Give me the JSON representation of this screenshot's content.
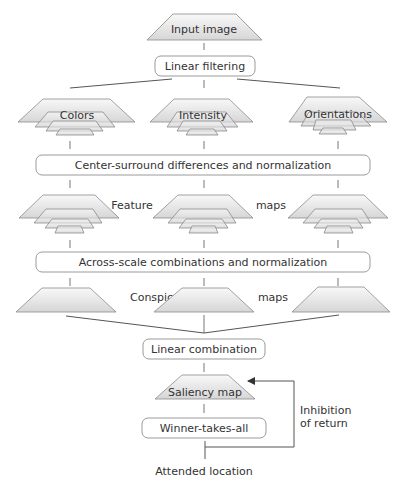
{
  "diagram": {
    "input": {
      "label": "Input image"
    },
    "linear_filtering": {
      "label": "Linear filtering"
    },
    "channels": [
      {
        "id": "colors",
        "label": "Colors"
      },
      {
        "id": "intensity",
        "label": "Intensity"
      },
      {
        "id": "orientations",
        "label": "Orientations"
      }
    ],
    "center_surround": {
      "label": "Center-surround differences and normalization"
    },
    "feature_maps": {
      "label_left": "Feature",
      "label_right": "maps"
    },
    "across_scale": {
      "label": "Across-scale combinations and normalization"
    },
    "conspicuity_maps": {
      "label_left": "Conspicuity",
      "label_right": "maps"
    },
    "linear_combination": {
      "label": "Linear combination"
    },
    "saliency_map": {
      "label": "Saliency map"
    },
    "winner_takes_all": {
      "label": "Winner-takes-all"
    },
    "inhibition": {
      "line1": "Inhibition",
      "line2": "of return"
    },
    "output": {
      "label": "Attended location"
    },
    "colors": {
      "stroke": "#9a9a9a",
      "text": "#333333",
      "fill_light": "#f4f4f4",
      "fill_dark": "#d8d8d8"
    }
  }
}
